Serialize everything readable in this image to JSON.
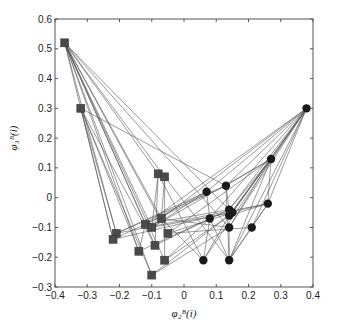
{
  "chart_data": {
    "type": "scatter",
    "title": "",
    "xlabel": "φ₂ᴮ(i)",
    "ylabel": "φ₃ᴮ(i)",
    "xlim": [
      -0.4,
      0.4
    ],
    "ylim": [
      -0.3,
      0.6
    ],
    "xticks": [
      -0.4,
      -0.3,
      -0.2,
      -0.1,
      0,
      0.1,
      0.2,
      0.3,
      0.4
    ],
    "yticks": [
      -0.3,
      -0.2,
      -0.1,
      0,
      0.1,
      0.2,
      0.3,
      0.4,
      0.5,
      0.6
    ],
    "xtick_labels": [
      "−0.4",
      "−0.3",
      "−0.2",
      "−0.1",
      "0",
      "0.1",
      "0.2",
      "0.3",
      "0.4"
    ],
    "ytick_labels": [
      "−0.3",
      "−0.2",
      "−0.1",
      "0",
      "0.1",
      "0.2",
      "0.3",
      "0.4",
      "0.5",
      "0.6"
    ],
    "grid": false,
    "series": [
      {
        "name": "squares",
        "marker": "square",
        "color": "#4a4a4a",
        "points": [
          [
            -0.37,
            0.52
          ],
          [
            -0.32,
            0.3
          ],
          [
            -0.08,
            0.08
          ],
          [
            -0.06,
            0.07
          ],
          [
            -0.07,
            -0.07
          ],
          [
            -0.12,
            -0.09
          ],
          [
            -0.1,
            -0.1
          ],
          [
            -0.21,
            -0.12
          ],
          [
            -0.22,
            -0.14
          ],
          [
            -0.05,
            -0.12
          ],
          [
            -0.09,
            -0.16
          ],
          [
            -0.14,
            -0.18
          ],
          [
            -0.06,
            -0.21
          ],
          [
            -0.1,
            -0.26
          ]
        ]
      },
      {
        "name": "circles",
        "marker": "circle",
        "color": "#1a1a1a",
        "points": [
          [
            0.38,
            0.3
          ],
          [
            0.27,
            0.13
          ],
          [
            0.13,
            0.04
          ],
          [
            0.07,
            0.02
          ],
          [
            0.26,
            -0.02
          ],
          [
            0.14,
            -0.04
          ],
          [
            0.15,
            -0.05
          ],
          [
            0.14,
            -0.06
          ],
          [
            0.08,
            -0.07
          ],
          [
            0.14,
            -0.1
          ],
          [
            0.21,
            -0.1
          ],
          [
            0.06,
            -0.21
          ],
          [
            0.14,
            -0.21
          ]
        ]
      }
    ],
    "edges": [
      [
        "s0",
        "s4"
      ],
      [
        "s0",
        "s5"
      ],
      [
        "s0",
        "s6"
      ],
      [
        "s0",
        "s7"
      ],
      [
        "s0",
        "s8"
      ],
      [
        "s0",
        "s9"
      ],
      [
        "s0",
        "s10"
      ],
      [
        "s0",
        "s11"
      ],
      [
        "s0",
        "s12"
      ],
      [
        "s0",
        "s13"
      ],
      [
        "s0",
        "s2"
      ],
      [
        "s0",
        "s3"
      ],
      [
        "s0",
        "c5"
      ],
      [
        "s0",
        "c9"
      ],
      [
        "s1",
        "s7"
      ],
      [
        "s1",
        "s8"
      ],
      [
        "s1",
        "s10"
      ],
      [
        "s1",
        "s11"
      ],
      [
        "s1",
        "s13"
      ],
      [
        "s1",
        "c2"
      ],
      [
        "c0",
        "c1"
      ],
      [
        "c0",
        "c2"
      ],
      [
        "c0",
        "c3"
      ],
      [
        "c0",
        "c4"
      ],
      [
        "c0",
        "c5"
      ],
      [
        "c0",
        "c6"
      ],
      [
        "c0",
        "c7"
      ],
      [
        "c0",
        "c8"
      ],
      [
        "c0",
        "c9"
      ],
      [
        "c0",
        "c10"
      ],
      [
        "c0",
        "c11"
      ],
      [
        "c0",
        "c12"
      ],
      [
        "c0",
        "s4"
      ],
      [
        "c0",
        "s5"
      ],
      [
        "c1",
        "c2"
      ],
      [
        "c1",
        "c5"
      ],
      [
        "c1",
        "c6"
      ],
      [
        "c1",
        "c7"
      ],
      [
        "c1",
        "c9"
      ],
      [
        "c1",
        "c12"
      ],
      [
        "c1",
        "s6"
      ],
      [
        "c1",
        "s9"
      ],
      [
        "c1",
        "c4"
      ],
      [
        "c4",
        "c7"
      ],
      [
        "c4",
        "c10"
      ],
      [
        "c4",
        "c12"
      ],
      [
        "c4",
        "s7"
      ],
      [
        "c4",
        "s8"
      ],
      [
        "c2",
        "c5"
      ],
      [
        "c2",
        "s7"
      ],
      [
        "c2",
        "s8"
      ],
      [
        "c2",
        "c12"
      ],
      [
        "c3",
        "s7"
      ],
      [
        "c3",
        "s6"
      ],
      [
        "c3",
        "c8"
      ],
      [
        "c5",
        "s5"
      ],
      [
        "c5",
        "s10"
      ],
      [
        "c6",
        "s9"
      ],
      [
        "c7",
        "s12"
      ],
      [
        "c8",
        "s11"
      ],
      [
        "c8",
        "c11"
      ],
      [
        "c9",
        "s13"
      ],
      [
        "c9",
        "c12"
      ],
      [
        "c10",
        "c12"
      ],
      [
        "c11",
        "s4"
      ],
      [
        "c11",
        "c7"
      ],
      [
        "c12",
        "c8"
      ],
      [
        "s2",
        "s10"
      ],
      [
        "s2",
        "s6"
      ],
      [
        "s2",
        "c11"
      ],
      [
        "s3",
        "s12"
      ],
      [
        "s3",
        "s4"
      ],
      [
        "s3",
        "c12"
      ],
      [
        "s4",
        "c9"
      ],
      [
        "s5",
        "c3"
      ],
      [
        "s6",
        "c6"
      ],
      [
        "s9",
        "c10"
      ],
      [
        "s12",
        "c8"
      ],
      [
        "s13",
        "c7"
      ],
      [
        "s11",
        "s5"
      ]
    ]
  }
}
